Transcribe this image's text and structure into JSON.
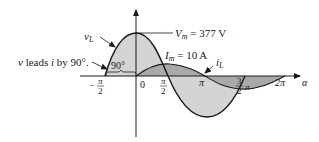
{
  "diagram": {
    "type": "phasor-waveform",
    "colors": {
      "axis": "#1a1a1a",
      "voltage_fill": "#d4d4d4",
      "current_fill": "#a9a9a9",
      "curve": "#1a1a1a"
    },
    "axis": {
      "x_symbol": "α",
      "ticks": [
        {
          "key": "neg_pi_2",
          "sign": "−",
          "num": "π",
          "den": "2"
        },
        {
          "key": "zero",
          "label": "0"
        },
        {
          "key": "pi_2",
          "num": "π",
          "den": "2"
        },
        {
          "key": "pi",
          "label": "π"
        },
        {
          "key": "three_pi_2",
          "num": "3",
          "den": "2",
          "suffix": "π"
        },
        {
          "key": "two_pi",
          "label": "2π"
        }
      ]
    },
    "labels": {
      "vL_main": "v",
      "vL_sub": "L",
      "iL_main": "i",
      "iL_sub": "L",
      "Vm_main": "V",
      "Vm_sub": "m",
      "Vm_value": " = 377 V",
      "Im_main": "I",
      "Im_sub": "m",
      "Im_value": " = 10 A",
      "phase_angle": "90°",
      "lead_v": "v",
      "lead_text1": " leads ",
      "lead_i": "i",
      "lead_text2": " by 90°."
    },
    "waveforms": [
      {
        "name": "v_L",
        "amplitude": 377,
        "unit": "V",
        "phase_deg": 90
      },
      {
        "name": "i_L",
        "amplitude": 10,
        "unit": "A",
        "phase_deg": 0
      }
    ]
  }
}
